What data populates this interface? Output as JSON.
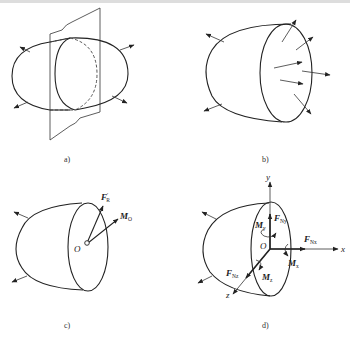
{
  "header_text": "（截断的上方文字）",
  "panels": {
    "a": {
      "caption": "a)"
    },
    "b": {
      "caption": "b)"
    },
    "c": {
      "caption": "c)",
      "labels": {
        "force": "F",
        "force_sub": "R",
        "force_prime": "′",
        "moment": "M",
        "moment_sub": "O",
        "origin": "O"
      }
    },
    "d": {
      "caption": "d)",
      "axes": {
        "x": "x",
        "y": "y",
        "z": "z",
        "origin": "O"
      },
      "labels": {
        "fy": "F",
        "fy_sub": "Ny",
        "fx": "F",
        "fx_sub": "Nx",
        "fz": "F",
        "fz_sub": "Nz",
        "my": "M",
        "my_sub": "y",
        "mx": "M",
        "mx_sub": "x",
        "mz": "M",
        "mz_sub": "z"
      }
    }
  }
}
